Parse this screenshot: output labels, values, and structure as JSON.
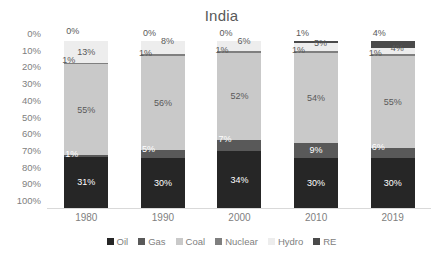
{
  "chart_data": {
    "type": "bar",
    "subtype": "100% stacked column",
    "title": "India",
    "xlabel": "",
    "ylabel": "",
    "ylim": [
      0,
      100
    ],
    "yticks": [
      "0%",
      "10%",
      "20%",
      "30%",
      "40%",
      "50%",
      "60%",
      "70%",
      "80%",
      "90%",
      "100%"
    ],
    "grid": false,
    "legend_position": "bottom",
    "categories": [
      "1980",
      "1990",
      "2000",
      "2010",
      "2019"
    ],
    "series": [
      {
        "name": "Oil",
        "color": "#262626",
        "values": [
          31,
          30,
          34,
          30,
          30
        ],
        "labels": [
          "31%",
          "30%",
          "34%",
          "30%",
          "30%"
        ]
      },
      {
        "name": "Gas",
        "color": "#595959",
        "values": [
          1,
          5,
          7,
          9,
          6
        ],
        "labels": [
          "1%",
          "5%",
          "7%",
          "9%",
          "6%"
        ]
      },
      {
        "name": "Coal",
        "color": "#c9c9c9",
        "values": [
          55,
          56,
          52,
          54,
          55
        ],
        "labels": [
          "55%",
          "56%",
          "52%",
          "54%",
          "55%"
        ]
      },
      {
        "name": "Nuclear",
        "color": "#7f7f7f",
        "values": [
          1,
          1,
          1,
          1,
          1
        ],
        "labels": [
          "1%",
          "1%",
          "1%",
          "1%",
          "1%"
        ]
      },
      {
        "name": "Hydro",
        "color": "#ededed",
        "values": [
          13,
          8,
          6,
          5,
          4
        ],
        "labels": [
          "13%",
          "8%",
          "6%",
          "5%",
          "4%"
        ]
      },
      {
        "name": "RE",
        "color": "#4a4a4a",
        "values": [
          0,
          0,
          0,
          1,
          4
        ],
        "labels": [
          "0%",
          "0%",
          "0%",
          "1%",
          "4%"
        ]
      }
    ]
  },
  "legend": {
    "items": [
      {
        "label": "Oil"
      },
      {
        "label": "Gas"
      },
      {
        "label": "Coal"
      },
      {
        "label": "Nuclear"
      },
      {
        "label": "Hydro"
      },
      {
        "label": "RE"
      }
    ]
  }
}
